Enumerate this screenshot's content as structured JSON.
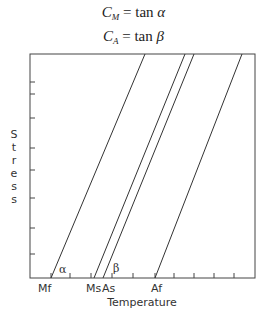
{
  "equations": [
    {
      "lhs": "C",
      "sub": "M",
      "rhs_func": "tan",
      "rhs_arg": "α"
    },
    {
      "lhs": "C",
      "sub": "A",
      "rhs_func": "tan",
      "rhs_arg": "β"
    }
  ],
  "diagram": {
    "type": "stress-temperature phase diagram",
    "y_axis_label": [
      "S",
      "t",
      "r",
      "e",
      "s",
      "s"
    ],
    "x_axis_label": "Temperature",
    "x_markers": [
      {
        "id": "mf",
        "label": "Mf",
        "x_base": 51
      },
      {
        "id": "ms",
        "label": "Ms",
        "x_base": 94
      },
      {
        "id": "as",
        "label": "As",
        "x_base": 103
      },
      {
        "id": "af",
        "label": "Af",
        "x_base": 155
      }
    ],
    "angle_labels": {
      "alpha": "α",
      "beta": "β"
    },
    "line_color": "#333333"
  }
}
